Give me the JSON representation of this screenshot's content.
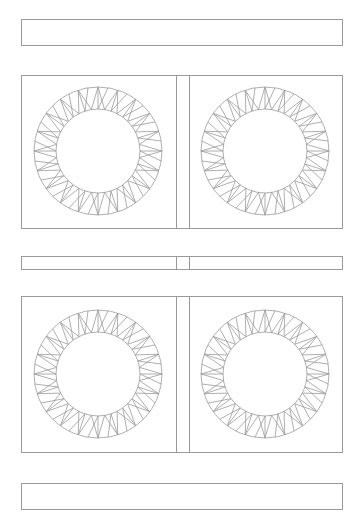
{
  "diagram": {
    "line_color": "#9a9a9a",
    "background": "#ffffff",
    "top_strip": {
      "x": 21,
      "y": 19,
      "w": 322,
      "h": 26
    },
    "middle_strip": {
      "x": 21,
      "y": 256,
      "w": 322,
      "h": 13
    },
    "bottom_strip": {
      "x": 21,
      "y": 483,
      "w": 322,
      "h": 26
    },
    "sashing_column": {
      "x1": 176,
      "x2": 189
    },
    "panel_rows": [
      {
        "y": 75,
        "h": 153
      },
      {
        "y": 296,
        "h": 156
      }
    ],
    "rings": [
      {
        "cx": 98,
        "cy": 151,
        "r_outer": 64,
        "r_inner": 42,
        "points": 20
      },
      {
        "cx": 265,
        "cy": 151,
        "r_outer": 64,
        "r_inner": 42,
        "points": 20
      },
      {
        "cx": 98,
        "cy": 374,
        "r_outer": 64,
        "r_inner": 42,
        "points": 20
      },
      {
        "cx": 265,
        "cy": 374,
        "r_outer": 64,
        "r_inner": 42,
        "points": 20
      }
    ]
  }
}
